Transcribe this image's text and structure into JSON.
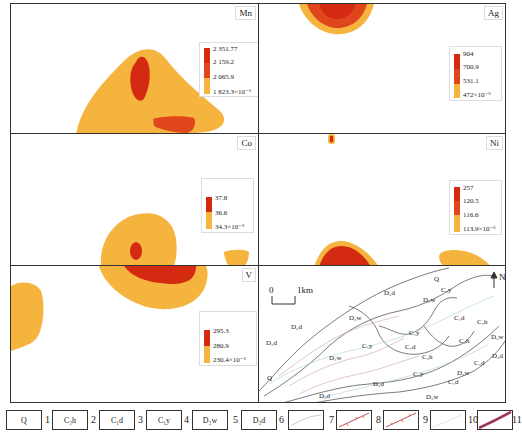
{
  "panels": [
    {
      "element": "Mn",
      "legend": [
        "2 351.77",
        "2 159.2",
        "2 065.9",
        "1 823.3×10⁻⁶"
      ]
    },
    {
      "element": "Ag",
      "legend": [
        "904",
        "700.9",
        "531.1",
        "472×10⁻⁹"
      ]
    },
    {
      "element": "Co",
      "legend": [
        "37.8",
        "36.6",
        "34.3×10⁻⁶"
      ]
    },
    {
      "element": "Ni",
      "legend": [
        "257",
        "120.5",
        "116.6",
        "113.9×10⁻⁶"
      ]
    },
    {
      "element": "V",
      "legend": [
        "295.3",
        "280.9",
        "230.4×10⁻⁶"
      ]
    }
  ],
  "colors": {
    "high": "#d42a12",
    "mid": "#e0461c",
    "low": "#f5b43e",
    "border": "#333333"
  },
  "geologic_map": {
    "scale_zero": "0",
    "scale_label": "1km",
    "north": "N",
    "labels": [
      {
        "text": "D₃d",
        "x": 383,
        "y": 289
      },
      {
        "text": "Q",
        "x": 433,
        "y": 275
      },
      {
        "text": "C₁y",
        "x": 440,
        "y": 286
      },
      {
        "text": "D₃w",
        "x": 422,
        "y": 296
      },
      {
        "text": "D₃w",
        "x": 348,
        "y": 314
      },
      {
        "text": "D₃d",
        "x": 290,
        "y": 323
      },
      {
        "text": "C₁d",
        "x": 453,
        "y": 314
      },
      {
        "text": "C₂h",
        "x": 476,
        "y": 318
      },
      {
        "text": "C₁y",
        "x": 408,
        "y": 329
      },
      {
        "text": "D₃w",
        "x": 490,
        "y": 333
      },
      {
        "text": "D₃d",
        "x": 265,
        "y": 339
      },
      {
        "text": "C₁y",
        "x": 361,
        "y": 342
      },
      {
        "text": "C₁d",
        "x": 404,
        "y": 343
      },
      {
        "text": "C₂h",
        "x": 458,
        "y": 337
      },
      {
        "text": "C₂h",
        "x": 421,
        "y": 353
      },
      {
        "text": "D₃d",
        "x": 491,
        "y": 352
      },
      {
        "text": "D₃w",
        "x": 328,
        "y": 354
      },
      {
        "text": "C₁d",
        "x": 473,
        "y": 359
      },
      {
        "text": "C₁y",
        "x": 412,
        "y": 370
      },
      {
        "text": "D₃w",
        "x": 456,
        "y": 369
      },
      {
        "text": "C₁d",
        "x": 447,
        "y": 378
      },
      {
        "text": "Q",
        "x": 266,
        "y": 374
      },
      {
        "text": "D₃d",
        "x": 372,
        "y": 380
      },
      {
        "text": "D₃d",
        "x": 318,
        "y": 392
      },
      {
        "text": "D₃w",
        "x": 425,
        "y": 393
      }
    ]
  },
  "map_legend": [
    {
      "num": "1",
      "label": "Q",
      "type": "box"
    },
    {
      "num": "2",
      "label": "C₂h",
      "type": "box"
    },
    {
      "num": "3",
      "label": "C₁d",
      "type": "box"
    },
    {
      "num": "4",
      "label": "C₁y",
      "type": "box"
    },
    {
      "num": "5",
      "label": "D₃w",
      "type": "box"
    },
    {
      "num": "6",
      "label": "D₃d",
      "type": "box"
    },
    {
      "num": "7",
      "label": "",
      "type": "gray-line"
    },
    {
      "num": "8",
      "label": "",
      "type": "fault-red"
    },
    {
      "num": "9",
      "label": "",
      "type": "fault-red2"
    },
    {
      "num": "10",
      "label": "",
      "type": "faint-line"
    },
    {
      "num": "11",
      "label": "",
      "type": "purple-line"
    }
  ]
}
